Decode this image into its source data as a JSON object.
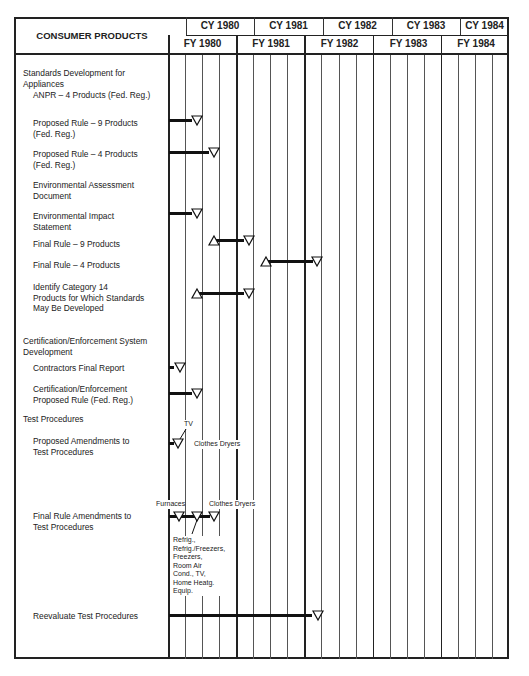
{
  "header": {
    "title": "CONSUMER PRODUCTS",
    "calendar_years": [
      "CY 1980",
      "CY 1981",
      "CY 1982",
      "CY 1983",
      "CY 1984"
    ],
    "fiscal_years": [
      "FY 1980",
      "FY 1981",
      "FY 1982",
      "FY 1983",
      "FY 1984"
    ]
  },
  "rows": [
    {
      "label": "Standards Development for\nAppliances"
    },
    {
      "label": "ANPR – 4 Products (Fed. Reg.)"
    },
    {
      "label": "Proposed Rule – 9 Products\n(Fed. Reg.)"
    },
    {
      "label": "Proposed Rule – 4 Products\n(Fed. Reg.)"
    },
    {
      "label": "Environmental Assessment\nDocument"
    },
    {
      "label": "Environmental Impact\nStatement"
    },
    {
      "label": "Final Rule – 9 Products"
    },
    {
      "label": "Final Rule – 4 Products"
    },
    {
      "label": "Identify Category 14\nProducts for Which Standards\nMay Be Developed"
    },
    {
      "label": "Certification/Enforcement System\nDevelopment"
    },
    {
      "label": "Contractors Final Report"
    },
    {
      "label": "Certification/Enforcement\nProposed Rule (Fed. Reg.)"
    },
    {
      "label": "Test Procedures"
    },
    {
      "label": "Proposed Amendments to\nTest Procedures"
    },
    {
      "label": "Final Rule Amendments to\nTest Procedures"
    },
    {
      "label": "Reevaluate Test Procedures"
    }
  ],
  "annotations": {
    "tv": "TV",
    "clothes_dryers_1": "Clothes Dryers",
    "furnaces": "Furnaces",
    "clothes_dryers_2": "Clothes Dryers",
    "refrig_list": "Refrig.,\nRefrig./Freezers,\nFreezers,\nRoom Air\nCond., TV,\nHome Heatg.\nEquip."
  },
  "chart_data": {
    "type": "gantt",
    "title": "CONSUMER PRODUCTS",
    "time_axis": {
      "fiscal_years": [
        "FY 1980",
        "FY 1981",
        "FY 1982",
        "FY 1983",
        "FY 1984"
      ],
      "calendar_years": [
        "CY 1980",
        "CY 1981",
        "CY 1982",
        "CY 1983",
        "CY 1984"
      ],
      "subdivisions": "quarters (4 per fiscal year)"
    },
    "legend": {
      "open_triangle_up": "start",
      "open_triangle_down": "completion",
      "thick_bar": "activity duration"
    },
    "tasks": [
      {
        "task": "Proposed Rule – 9 Products (Fed. Reg.)",
        "start_q": 0,
        "end_q": 1.5
      },
      {
        "task": "Proposed Rule – 4 Products (Fed. Reg.)",
        "start_q": 0,
        "end_q": 2.5
      },
      {
        "task": "Environmental Impact Statement",
        "start_q": 0,
        "end_q": 1.5
      },
      {
        "task": "Final Rule – 9 Products",
        "start_q": 2.5,
        "end_q": 4.5
      },
      {
        "task": "Final Rule – 4 Products",
        "start_q": 5.5,
        "end_q": 8.5
      },
      {
        "task": "Identify Category 14 Products",
        "start_q": 1.5,
        "end_q": 4.5
      },
      {
        "task": "Contractors Final Report",
        "start_q": 0,
        "end_q": 0.5
      },
      {
        "task": "Certification/Enforcement Proposed Rule",
        "start_q": 0,
        "end_q": 1.5
      },
      {
        "task": "Proposed Amendments to Test Procedures",
        "start_q": 0,
        "end_q": 0.5,
        "notes": [
          "TV",
          "Clothes Dryers"
        ]
      },
      {
        "task": "Final Rule Amendments to Test Procedures",
        "start_q": 0,
        "end_q": 2.5,
        "milestones_q": [
          0.5,
          1.5,
          2.5
        ],
        "notes": [
          "Furnaces",
          "Refrig., Refrig./Freezers, Freezers, Room Air Cond., TV, Home Heatg. Equip.",
          "Clothes Dryers"
        ]
      },
      {
        "task": "Reevaluate Test Procedures",
        "start_q": 0,
        "end_q": 8.5
      }
    ]
  }
}
